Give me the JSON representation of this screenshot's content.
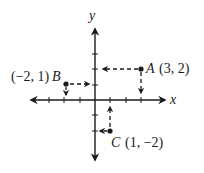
{
  "diagram": {
    "type": "coordinate-plane",
    "origin_px": [
      95,
      100
    ],
    "unit_px": 15.3,
    "axes": {
      "x_label": "x",
      "y_label": "y",
      "x_ticks": [
        -3,
        -2,
        -1,
        1,
        2,
        3
      ],
      "y_ticks": [
        -2,
        -1,
        1,
        2,
        3
      ]
    },
    "points": [
      {
        "name": "A",
        "coords_label": "(3, 2)",
        "x": 3,
        "y": 2
      },
      {
        "name": "B",
        "coords_label": "(−2, 1)",
        "x": -2,
        "y": 1
      },
      {
        "name": "C",
        "coords_label": "(1, −2)",
        "x": 1,
        "y": -2
      }
    ]
  },
  "colors": {
    "ink": "#1a1a1a",
    "background": "#ffffff"
  }
}
